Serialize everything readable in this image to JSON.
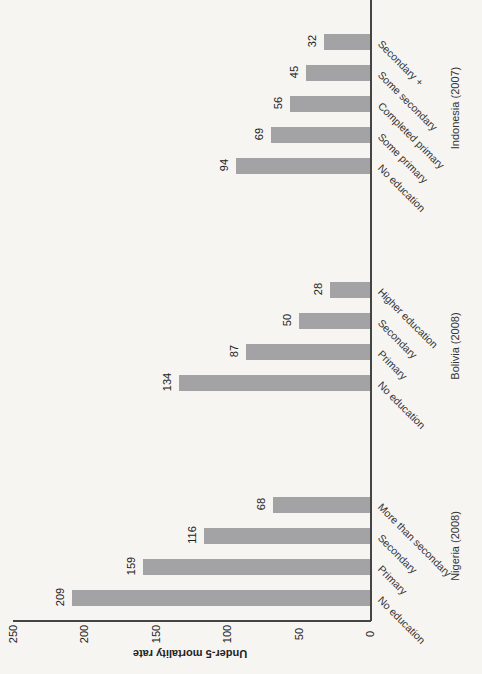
{
  "chart_data": {
    "type": "bar",
    "orientation": "rotated 90° (bars extend left from baseline on right; page viewed sideways)",
    "ylabel": "Under-5 mortality rate",
    "xlabel": "",
    "ylim": [
      0,
      250
    ],
    "yticks": [
      0,
      50,
      100,
      150,
      200,
      250
    ],
    "grid": false,
    "groups": [
      {
        "name": "Nigeria (2008)",
        "categories": [
          "No education",
          "Primary",
          "Secondary",
          "More than secondary"
        ],
        "values": [
          209,
          159,
          116,
          68
        ]
      },
      {
        "name": "Bolivia (2008)",
        "categories": [
          "No education",
          "Primary",
          "Secondary",
          "Higher education"
        ],
        "values": [
          134,
          87,
          50,
          28
        ]
      },
      {
        "name": "Indonesia (2007)",
        "categories": [
          "No education",
          "Some primary",
          "Completed primary",
          "Some secondary",
          "Secondary +"
        ],
        "values": [
          94,
          69,
          56,
          45,
          32
        ]
      }
    ]
  },
  "axis": {
    "label": "Under-5 mortality rate",
    "ticks": [
      "0",
      "50",
      "100",
      "150",
      "200",
      "250"
    ]
  },
  "groups": [
    {
      "name": "Indonesia (2007)",
      "bars": [
        {
          "label": "Secondary +",
          "value": "32"
        },
        {
          "label": "Some secondary",
          "value": "45"
        },
        {
          "label": "Completed primary",
          "value": "56"
        },
        {
          "label": "Some primary",
          "value": "69"
        },
        {
          "label": "No education",
          "value": "94"
        }
      ]
    },
    {
      "name": "Bolivia (2008)",
      "bars": [
        {
          "label": "Higher education",
          "value": "28"
        },
        {
          "label": "Secondary",
          "value": "50"
        },
        {
          "label": "Primary",
          "value": "87"
        },
        {
          "label": "No education",
          "value": "134"
        }
      ]
    },
    {
      "name": "Nigeria (2008)",
      "bars": [
        {
          "label": "More than secondary",
          "value": "68"
        },
        {
          "label": "Secondary",
          "value": "116"
        },
        {
          "label": "Primary",
          "value": "159"
        },
        {
          "label": "No education",
          "value": "209"
        }
      ]
    }
  ],
  "colors": {
    "bar": "#a3a3a6",
    "axis": "#444444",
    "background": "#f6f5f2"
  }
}
